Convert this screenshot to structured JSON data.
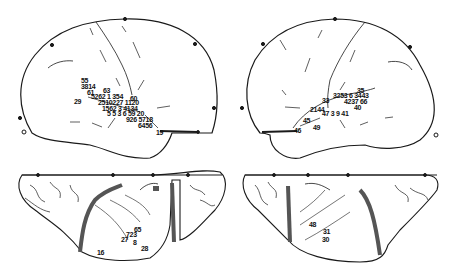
{
  "figure": {
    "panels": [
      {
        "id": "left-lateral",
        "view": "left hemisphere lateral",
        "labels": [
          {
            "text": "55",
            "x": 81,
            "y": 77
          },
          {
            "text": "3814",
            "x": 81,
            "y": 83
          },
          {
            "text": "61",
            "x": 87,
            "y": 89
          },
          {
            "text": "63",
            "x": 103,
            "y": 88
          },
          {
            "text": "5262 1 354",
            "x": 91,
            "y": 94
          },
          {
            "text": "60",
            "x": 130,
            "y": 95
          },
          {
            "text": "29",
            "x": 74,
            "y": 99
          },
          {
            "text": "2510227 1120",
            "x": 98,
            "y": 100
          },
          {
            "text": "1562 3 4134",
            "x": 102,
            "y": 106
          },
          {
            "text": "5 5 3 6 59 20",
            "x": 107,
            "y": 111
          },
          {
            "text": "926 5718",
            "x": 126,
            "y": 117
          },
          {
            "text": "6456",
            "x": 138,
            "y": 122
          },
          {
            "text": "19",
            "x": 156,
            "y": 129
          }
        ]
      },
      {
        "id": "right-lateral",
        "view": "right hemisphere lateral",
        "labels": [
          {
            "text": "35",
            "x": 357,
            "y": 88
          },
          {
            "text": "3253 6 3443",
            "x": 333,
            "y": 93
          },
          {
            "text": "33",
            "x": 322,
            "y": 97
          },
          {
            "text": "4237 66",
            "x": 344,
            "y": 98
          },
          {
            "text": "2144",
            "x": 310,
            "y": 107
          },
          {
            "text": "47 3 9 41",
            "x": 322,
            "y": 110
          },
          {
            "text": "40",
            "x": 354,
            "y": 104
          },
          {
            "text": "45",
            "x": 303,
            "y": 118
          },
          {
            "text": "46",
            "x": 294,
            "y": 128
          },
          {
            "text": "49",
            "x": 313,
            "y": 125
          }
        ]
      },
      {
        "id": "left-inferior",
        "view": "left hemisphere inferior",
        "labels": [
          {
            "text": "65",
            "x": 134,
            "y": 226
          },
          {
            "text": "723",
            "x": 126,
            "y": 231
          },
          {
            "text": "27",
            "x": 121,
            "y": 236
          },
          {
            "text": "8",
            "x": 133,
            "y": 239
          },
          {
            "text": "28",
            "x": 141,
            "y": 245
          },
          {
            "text": "16",
            "x": 97,
            "y": 249
          }
        ]
      },
      {
        "id": "right-inferior",
        "view": "right hemisphere inferior",
        "labels": [
          {
            "text": "48",
            "x": 309,
            "y": 221
          },
          {
            "text": "31",
            "x": 323,
            "y": 228
          },
          {
            "text": "30",
            "x": 322,
            "y": 236
          }
        ]
      }
    ],
    "colors": {
      "ink": "#1a1a1a",
      "background": "#ffffff",
      "shading": "#555555"
    }
  }
}
